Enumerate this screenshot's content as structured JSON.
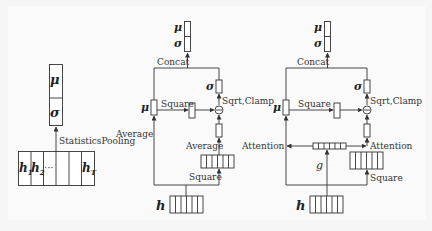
{
  "panel1": {
    "mu": "μ",
    "sigma": "σ",
    "op_label": "StatisticsPooling",
    "h1": "h",
    "h1_sub": "1",
    "h2": "h",
    "h2_sub": "2",
    "dots": "···",
    "hT": "h",
    "hT_sub": "T"
  },
  "panel2": {
    "out_mu": "μ",
    "out_sigma": "σ",
    "concat_label": "Concat",
    "sigma_label": "σ",
    "sqrt_label": "Sqrt,Clamp",
    "mu_label": "μ",
    "square_top_label": "Square",
    "average_left_label": "Average",
    "average_right_label": "Average",
    "square_bottom_label": "Square",
    "minus_symbol": "−",
    "h_label": "h"
  },
  "panel3": {
    "out_mu": "μ",
    "out_sigma": "σ",
    "concat_label": "Concat",
    "sigma_label": "σ",
    "sqrt_label": "Sqrt,Clamp",
    "mu_label": "μ",
    "square_top_label": "Square",
    "attention_left_label": "Attention",
    "attention_right_label": "Attention",
    "g_label": "g",
    "square_bottom_label": "Square",
    "minus_symbol": "−",
    "h_label": "h"
  },
  "colors": {
    "background": "#f6f6f6",
    "stroke": "#333333",
    "text": "#222222"
  }
}
